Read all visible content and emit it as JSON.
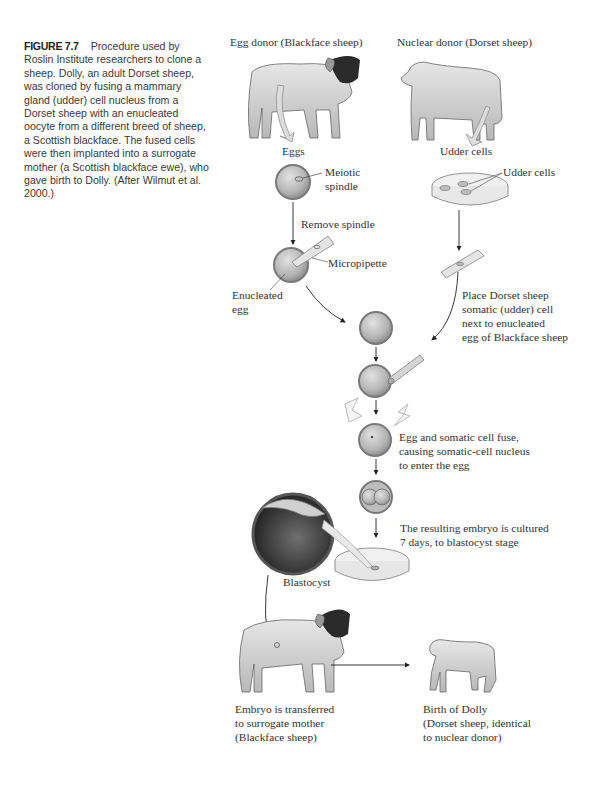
{
  "caption": {
    "figure_number": "FIGURE 7.7",
    "text": "Procedure used by Roslin Institute researchers to clone a sheep. Dolly, an adult Dorset sheep, was cloned by fusing a mammary gland (udder) cell nucleus from a Dorset sheep with an enucleated oocyte from a different breed of sheep, a Scottish blackface. The fused cells were then implanted into a surrogate mother (a Scottish blackface ewe), who gave birth to Dolly. (After Wilmut et al. 2000.)"
  },
  "diagram": {
    "egg_donor_title": "Egg donor (Blackface sheep)",
    "nuclear_donor_title": "Nuclear donor (Dorset sheep)",
    "eggs_label": "Eggs",
    "udder_cells_label": "Udder cells",
    "udder_cells_pointer": "Udder cells",
    "meiotic_spindle": [
      "Meiotic",
      "spindle"
    ],
    "remove_spindle": "Remove spindle",
    "micropipette": "Micropipette",
    "enucleated_egg": [
      "Enucleated",
      "egg"
    ],
    "place_cell": [
      "Place Dorset sheep",
      "somatic (udder) cell",
      "next to enucleated",
      "egg of Blackface sheep"
    ],
    "fuse": [
      "Egg and somatic cell fuse,",
      "causing somatic-cell nucleus",
      "to enter the egg"
    ],
    "cultured": [
      "The resulting embryo is cultured",
      "7 days, to blastocyst stage"
    ],
    "blastocyst": "Blastocyst",
    "transferred": [
      "Embryo is transferred",
      "to surrogate mother",
      "(Blackface sheep)"
    ],
    "birth": [
      "Birth of Dolly",
      "(Dorset sheep, identical",
      "to nuclear donor)"
    ]
  },
  "colors": {
    "cell_fill": "#b8b8b8",
    "cell_ring": "#8a8a8a",
    "sheep_body": "#d8d8d8",
    "blackface_head": "#2a2a2a",
    "text": "#333333"
  }
}
